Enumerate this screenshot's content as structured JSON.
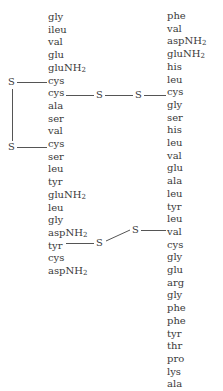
{
  "diagram": {
    "title": "",
    "type": "protein-primary-structure-disulfide-bonds",
    "chain_a": [
      "gly",
      "ileu",
      "val",
      "glu",
      "gluNH2",
      "cys",
      "cys",
      "ala",
      "ser",
      "val",
      "cys",
      "ser",
      "leu",
      "tyr",
      "gluNH2",
      "leu",
      "gly",
      "aspNH2",
      "tyr",
      "cys",
      "aspNH2"
    ],
    "chain_b": [
      "phe",
      "val",
      "aspNH2",
      "gluNH2",
      "his",
      "leu",
      "cys",
      "gly",
      "ser",
      "his",
      "leu",
      "val",
      "glu",
      "ala",
      "leu",
      "tyr",
      "leu",
      "val",
      "cys",
      "gly",
      "glu",
      "arg",
      "gly",
      "phe",
      "phe",
      "tyr",
      "thr",
      "pro",
      "lys",
      "ala"
    ],
    "bonds": [
      {
        "label": "intra-chain A",
        "from": "A6",
        "to": "A11",
        "atoms": [
          "S",
          "S"
        ]
      },
      {
        "label": "inter-chain",
        "from": "A7",
        "to": "B7",
        "atoms": [
          "S",
          "S"
        ]
      },
      {
        "label": "inter-chain",
        "from": "A20",
        "to": "B19",
        "atoms": [
          "S",
          "S"
        ]
      }
    ],
    "sulfur_label": "S"
  }
}
